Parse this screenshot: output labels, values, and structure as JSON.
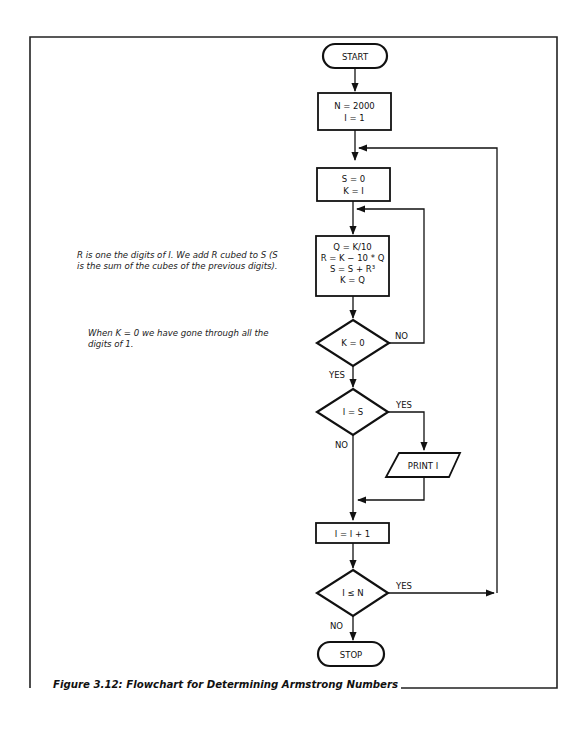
{
  "figure": {
    "caption": "Figure 3.12: Flowchart for Determining Armstrong Numbers"
  },
  "annotations": {
    "note_digits_line1": "R is one the digits of I. We add R cubed to S (S",
    "note_digits_line2": "is the sum of the cubes of the previous digits).",
    "note_k_line1": "When K = 0 we have gone through all the",
    "note_k_line2": "digits of 1."
  },
  "nodes": {
    "start": {
      "type": "terminal",
      "label": "START"
    },
    "init": {
      "type": "process",
      "lines": [
        "N = 2000",
        "I = 1"
      ]
    },
    "reset": {
      "type": "process",
      "lines": [
        "S = 0",
        "K = I"
      ]
    },
    "digit": {
      "type": "process",
      "lines": [
        "Q = K/10",
        "R = K − 10 * Q",
        "S = S + R³",
        "K = Q"
      ]
    },
    "k_zero": {
      "type": "decision",
      "label": "K = 0",
      "no": "NO",
      "yes": "YES"
    },
    "i_eq_s": {
      "type": "decision",
      "label": "I = S",
      "yes": "YES",
      "no": "NO"
    },
    "print": {
      "type": "io",
      "label": "PRINT I"
    },
    "incr": {
      "type": "process",
      "label": "I = I + 1"
    },
    "i_le_n": {
      "type": "decision",
      "label": "I ≤ N",
      "yes": "YES",
      "no": "NO"
    },
    "stop": {
      "type": "terminal",
      "label": "STOP"
    }
  },
  "edges": [
    {
      "from": "start",
      "to": "init"
    },
    {
      "from": "init",
      "to": "reset"
    },
    {
      "from": "reset",
      "to": "digit"
    },
    {
      "from": "digit",
      "to": "k_zero"
    },
    {
      "from": "k_zero",
      "to": "digit",
      "label": "NO"
    },
    {
      "from": "k_zero",
      "to": "i_eq_s",
      "label": "YES"
    },
    {
      "from": "i_eq_s",
      "to": "print",
      "label": "YES"
    },
    {
      "from": "i_eq_s",
      "to": "incr",
      "label": "NO"
    },
    {
      "from": "print",
      "to": "incr"
    },
    {
      "from": "incr",
      "to": "i_le_n"
    },
    {
      "from": "i_le_n",
      "to": "reset",
      "label": "YES"
    },
    {
      "from": "i_le_n",
      "to": "stop",
      "label": "NO"
    }
  ]
}
